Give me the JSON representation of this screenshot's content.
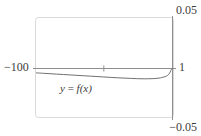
{
  "figure": {
    "kind": "function-plot",
    "background_color": "#ffffff",
    "frame_color": "#d6d6d6",
    "axis_color": "#8c8c8c",
    "curve_color": "#707070",
    "text_color": "#3c3c3c"
  },
  "labels": {
    "y_max": "0.05",
    "y_min": "−0.05",
    "x_min": "−100",
    "x_max": "1",
    "curve_left": "y",
    "curve_eq": " = ",
    "curve_right": "f(x)",
    "curve_full": "y = f(x)"
  },
  "chart_data": {
    "type": "line",
    "title": "",
    "xlabel": "",
    "ylabel": "",
    "xlim": [
      -100,
      1
    ],
    "ylim": [
      -0.05,
      0.05
    ],
    "xticks": [
      -100,
      1
    ],
    "xticklabels": [
      "−100",
      "1"
    ],
    "yticks": [
      -0.05,
      0.05
    ],
    "yticklabels": [
      "−0.05",
      "0.05"
    ],
    "grid": false,
    "legend": false,
    "annotations": [
      {
        "text": "y = f(x)",
        "x": -57,
        "y": -0.012,
        "style": "italic"
      }
    ],
    "axis_origin": {
      "x": 1,
      "y": 0
    },
    "interior_tick": {
      "x": -50,
      "y": 0
    },
    "series": [
      {
        "name": "y = f(x)",
        "color": "#707070",
        "x": [
          -100,
          -95,
          -90,
          -85,
          -80,
          -75,
          -70,
          -65,
          -60,
          -55,
          -50,
          -45,
          -40,
          -35,
          -30,
          -25,
          -20,
          -15,
          -12,
          -9,
          -7,
          -5,
          -3.5,
          -2.5,
          -1.8,
          -1.2,
          -0.7,
          -0.3,
          0,
          0.4,
          0.7,
          1
        ],
        "y": [
          -0.0043,
          -0.0047,
          -0.0051,
          -0.0055,
          -0.0059,
          -0.0063,
          -0.0067,
          -0.0071,
          -0.0075,
          -0.0079,
          -0.0083,
          -0.0087,
          -0.0091,
          -0.0094,
          -0.0097,
          -0.01,
          -0.0101,
          -0.01,
          -0.0098,
          -0.0094,
          -0.0089,
          -0.0082,
          -0.0074,
          -0.0066,
          -0.0057,
          -0.0046,
          -0.0034,
          -0.0021,
          -0.0014,
          -0.0007,
          -0.0003,
          0.0
        ]
      }
    ]
  }
}
